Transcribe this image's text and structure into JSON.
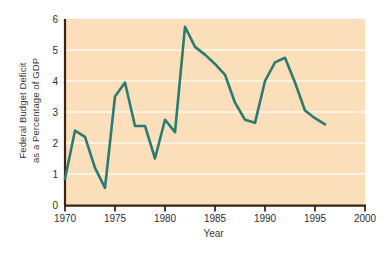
{
  "chart_data": {
    "type": "line",
    "title": "",
    "xlabel": "Year",
    "ylabel_lines": [
      "Federal Budget Deficit",
      "as a Percentage of GDP"
    ],
    "ylabel": "Federal Budget Deficit as a Percentage of GDP",
    "xlim": [
      1970,
      2000
    ],
    "ylim": [
      0,
      6
    ],
    "xticks": [
      1970,
      1975,
      1980,
      1985,
      1990,
      1995,
      2000
    ],
    "xticklabels": [
      "1970",
      "1975",
      "1980",
      "1985",
      "1990",
      "1995",
      "2000"
    ],
    "yticks": [
      0,
      1,
      2,
      3,
      4,
      5,
      6
    ],
    "yticklabels": [
      "0",
      "1",
      "2",
      "3",
      "4",
      "5",
      "6"
    ],
    "grid": "horizontal",
    "legend": "none",
    "series": [
      {
        "name": "Federal Budget Deficit as a Percentage of GDP",
        "color": "#2c7b70",
        "x": [
          1970,
          1971,
          1972,
          1973,
          1974,
          1975,
          1976,
          1977,
          1978,
          1979,
          1980,
          1981,
          1982,
          1983,
          1984,
          1985,
          1986,
          1987,
          1988,
          1989,
          1990,
          1991,
          1992,
          1993,
          1994,
          1995,
          1996
        ],
        "values": [
          0.85,
          2.4,
          2.2,
          1.2,
          0.55,
          3.5,
          3.95,
          2.55,
          2.55,
          1.5,
          2.75,
          2.35,
          5.75,
          5.1,
          4.85,
          4.55,
          4.2,
          3.3,
          2.75,
          2.65,
          4.0,
          4.6,
          4.75,
          3.95,
          3.05,
          2.8,
          2.6
        ]
      }
    ],
    "colors": {
      "line": "#2c7b70",
      "plot_background": "#fadfba",
      "gridline": "#fdf2e2",
      "axis": "#3a2418",
      "page_background": "#ffffff",
      "text": "#2e2e2e"
    }
  }
}
